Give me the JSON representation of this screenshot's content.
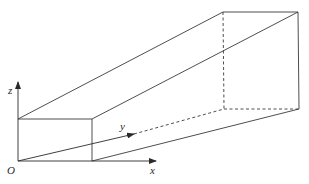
{
  "diagram": {
    "labels": {
      "origin": "O",
      "x_axis": "x",
      "y_axis": "y",
      "z_axis": "z"
    },
    "colors": {
      "stroke": "#3a3a3a",
      "background": "#ffffff"
    },
    "vertices": {
      "front_bottom_left": [
        18,
        161
      ],
      "front_bottom_right": [
        92,
        161
      ],
      "front_top_left": [
        18,
        119
      ],
      "front_top_right": [
        92,
        119
      ],
      "back_bottom_left": [
        224,
        109
      ],
      "back_bottom_right": [
        299,
        109
      ],
      "back_top_left": [
        223,
        12
      ],
      "back_top_right": [
        298,
        12
      ]
    }
  }
}
